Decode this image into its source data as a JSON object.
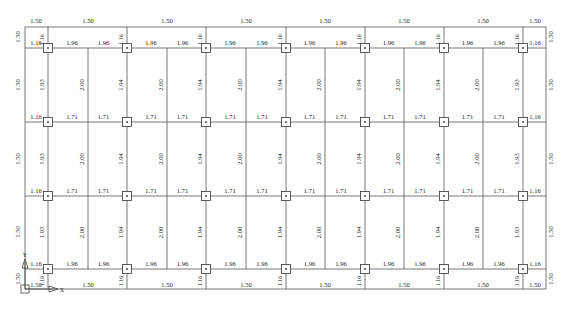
{
  "drawing": {
    "type": "structural-floor-plan-beam-span-labels",
    "caption": "",
    "colors": {
      "line": "#555555",
      "text": "#222222",
      "node_fill": "#ffffff",
      "node_stroke": "#333333"
    },
    "grid": {
      "x_lines": [
        25,
        48,
        88,
        127,
        167,
        206,
        246,
        286,
        325,
        365,
        404,
        444,
        483,
        523,
        546
      ],
      "y_lines": [
        27,
        48,
        122,
        196,
        269,
        289
      ],
      "column_x": [
        48,
        127,
        206,
        286,
        365,
        444,
        523
      ],
      "column_y": [
        48,
        122,
        196,
        269
      ]
    },
    "top_span_labels": [
      {
        "x": 36,
        "y": 23,
        "text": "1.50"
      },
      {
        "x": 88,
        "y": 23,
        "text": "1.50"
      },
      {
        "x": 167,
        "y": 23,
        "text": "1.50"
      },
      {
        "x": 246,
        "y": 23,
        "text": "1.50"
      },
      {
        "x": 325,
        "y": 23,
        "text": "1.50"
      },
      {
        "x": 404,
        "y": 23,
        "text": "1.50"
      },
      {
        "x": 483,
        "y": 23,
        "text": "1.50"
      },
      {
        "x": 535,
        "y": 23,
        "text": "1.50"
      }
    ],
    "bottom_span_labels": [
      {
        "x": 36,
        "y": 287,
        "text": "1.50"
      },
      {
        "x": 88,
        "y": 287,
        "text": "1.50"
      },
      {
        "x": 167,
        "y": 287,
        "text": "1.50"
      },
      {
        "x": 246,
        "y": 287,
        "text": "1.50"
      },
      {
        "x": 325,
        "y": 287,
        "text": "1.50"
      },
      {
        "x": 404,
        "y": 287,
        "text": "1.50"
      },
      {
        "x": 483,
        "y": 287,
        "text": "1.50"
      },
      {
        "x": 535,
        "y": 287,
        "text": "1.50"
      }
    ],
    "row_beam_labels": {
      "row_y": [
        45,
        119,
        193,
        266
      ],
      "edge_label": "1.16",
      "top_bottom_rows_value": "1.96",
      "middle_rows_value": "1.71"
    },
    "left_edge_vertical_labels": [
      {
        "y": 37,
        "text": "1.50"
      },
      {
        "y": 85,
        "text": "1.50"
      },
      {
        "y": 159,
        "text": "1.50"
      },
      {
        "y": 232,
        "text": "1.50"
      },
      {
        "y": 279,
        "text": "1.50"
      }
    ],
    "right_edge_vertical_labels": [
      {
        "y": 37,
        "text": "1.50"
      },
      {
        "y": 85,
        "text": "1.50"
      },
      {
        "y": 159,
        "text": "1.50"
      },
      {
        "y": 232,
        "text": "1.50"
      },
      {
        "y": 279,
        "text": "1.50"
      }
    ],
    "column_vertical_labels": {
      "short_span_top": "1.16",
      "short_span_bottom": "1.16",
      "outer_columns": "1.93",
      "inner_columns": "1.94",
      "mid_spans": "2.00"
    },
    "ucs_icon": {
      "x_label": "X",
      "y_label": "Y"
    }
  }
}
